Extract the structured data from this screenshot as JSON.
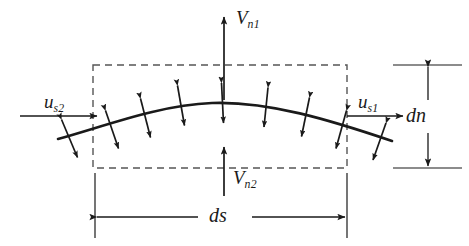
{
  "figure": {
    "type": "fluid-mechanics-control-volume-diagram",
    "background_color": "#ffffff",
    "line_color": "#1a1a1a",
    "dashed_color": "#555555"
  },
  "labels": {
    "velocity_normal_top": {
      "base": "V",
      "sub": "n1",
      "full": "Vn1"
    },
    "velocity_normal_bottom": {
      "base": "V",
      "sub": "n2",
      "full": "Vn2"
    },
    "velocity_tangential_left": {
      "base": "u",
      "sub": "s2",
      "full": "us2"
    },
    "velocity_tangential_right": {
      "base": "u",
      "sub": "s1",
      "full": "us1"
    },
    "dimension_height": {
      "base": "dn",
      "sub": "",
      "full": "dn"
    },
    "dimension_width": {
      "base": "ds",
      "sub": "",
      "full": "ds"
    }
  },
  "geometry": {
    "control_volume": {
      "x": 93,
      "y": 65,
      "width": 254,
      "height": 103
    },
    "curve": {
      "start": [
        58,
        139
      ],
      "peak": [
        212,
        103
      ],
      "end": [
        392,
        141
      ]
    },
    "arrows": {
      "vn1": {
        "x": 224,
        "y_from": 100,
        "y_to": 17,
        "direction": "up"
      },
      "vn2": {
        "x": 224,
        "y_from": 196,
        "y_to": 147,
        "direction": "up"
      },
      "us2": {
        "y": 116,
        "x_from": 20,
        "x_to": 96,
        "direction": "right"
      },
      "us1": {
        "y": 116,
        "x_from": 347,
        "x_to": 402,
        "direction": "right"
      }
    },
    "dimension_ds": {
      "y": 217,
      "x_from": 95,
      "x_to": 347
    },
    "dimension_dn": {
      "x": 428,
      "y_from": 65,
      "y_to": 168
    },
    "normal_double_arrows_count": 9
  }
}
